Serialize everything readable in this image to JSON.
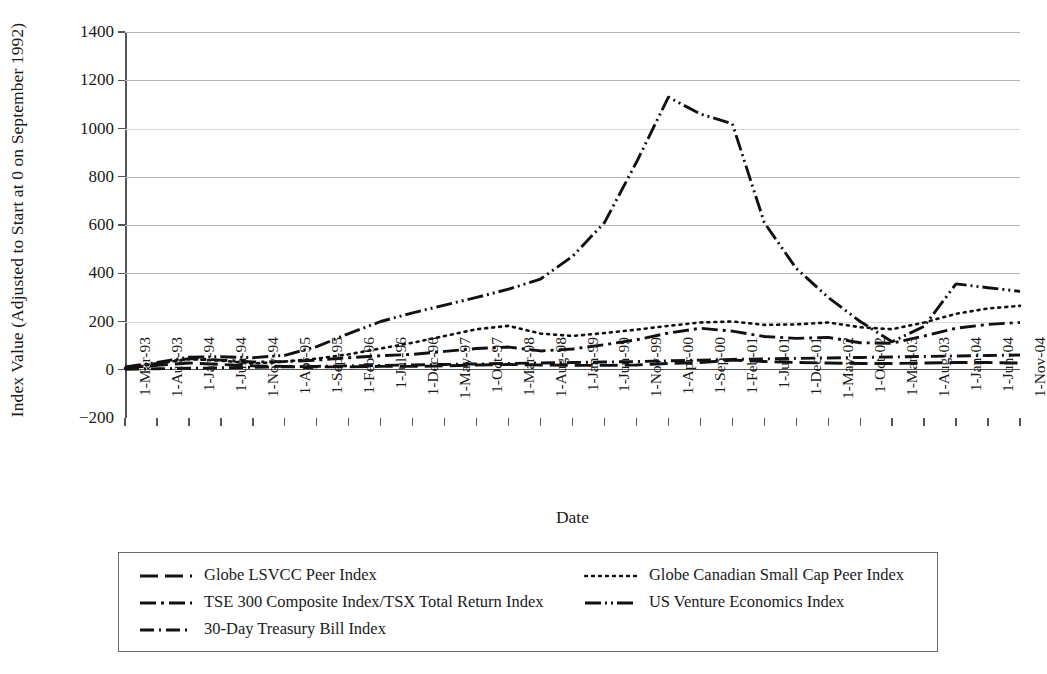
{
  "chart_data": {
    "type": "line",
    "title": "",
    "xlabel": "Date",
    "ylabel": "Index Value (Adjusted to Start at 0 on September 1992)",
    "ylim": [
      -200,
      1400
    ],
    "yticks": [
      -200,
      0,
      200,
      400,
      600,
      800,
      1000,
      1200,
      1400
    ],
    "grid": true,
    "legend_position": "bottom",
    "categories": [
      "1-Mar-93",
      "1-Aug-93",
      "1-Jan-94",
      "1-Jun-94",
      "1-Nov-94",
      "1-Apr-95",
      "1-Sep-95",
      "1-Feb-96",
      "1-Jul-96",
      "1-Dec-96",
      "1-May-97",
      "1-Oct-97",
      "1-Mar-98",
      "1-Aug-98",
      "1-Jan-99",
      "1-Jun-99",
      "1-Nov-99",
      "1-Apr-00",
      "1-Sep-00",
      "1-Feb-01",
      "1-Jul-01",
      "1-Dec-01",
      "1-May-02",
      "1-Oct-02",
      "1-Mar-03",
      "1-Aug-03",
      "1-Jan-04",
      "1-Jun-04",
      "1-Nov-04"
    ],
    "series": [
      {
        "name": "Globe LSVCC Peer Index",
        "dash": "18,7",
        "values": [
          8,
          18,
          28,
          22,
          16,
          14,
          12,
          12,
          14,
          14,
          16,
          20,
          22,
          20,
          18,
          18,
          20,
          26,
          30,
          40,
          34,
          30,
          28,
          26,
          26,
          28,
          30,
          30,
          28
        ]
      },
      {
        "name": "Globe Canadian Small Cap Peer Index",
        "dash": "2,5",
        "values": [
          6,
          26,
          44,
          38,
          26,
          34,
          46,
          64,
          88,
          112,
          140,
          168,
          182,
          150,
          140,
          152,
          166,
          182,
          196,
          200,
          186,
          188,
          196,
          176,
          168,
          196,
          232,
          254,
          265
        ]
      },
      {
        "name": "TSE 300 Composite Index/TSX Total Return Index",
        "dash": "16,5,3,5",
        "values": [
          10,
          26,
          46,
          40,
          32,
          34,
          40,
          50,
          58,
          64,
          76,
          88,
          94,
          78,
          86,
          104,
          124,
          152,
          172,
          160,
          138,
          130,
          134,
          112,
          110,
          140,
          172,
          188,
          196
        ]
      },
      {
        "name": "US Venture Economics Index",
        "dash": "16,4,2,4,2,4",
        "values": [
          12,
          30,
          52,
          54,
          50,
          60,
          96,
          150,
          200,
          236,
          268,
          300,
          334,
          376,
          470,
          610,
          860,
          1130,
          1060,
          1020,
          610,
          420,
          300,
          200,
          116,
          180,
          356,
          340,
          325
        ]
      },
      {
        "name": "30-Day Treasury Bill Index",
        "dash": "14,5,2,5",
        "values": [
          2,
          4,
          6,
          8,
          10,
          12,
          14,
          16,
          18,
          20,
          22,
          24,
          26,
          28,
          30,
          32,
          34,
          37,
          40,
          43,
          45,
          47,
          49,
          51,
          53,
          55,
          57,
          59,
          61
        ]
      }
    ]
  },
  "legend": {
    "rows": [
      {
        "left": {
          "label": "Globe LSVCC Peer Index",
          "dash": "18,7"
        },
        "right": {
          "label": "Globe Canadian Small Cap Peer Index",
          "dash": "2,5"
        }
      },
      {
        "left": {
          "label": "TSE 300 Composite Index/TSX Total Return Index",
          "dash": "16,5,3,5"
        },
        "right": {
          "label": "US Venture Economics Index",
          "dash": "16,4,2,4,2,4"
        }
      },
      {
        "left": {
          "label": "30-Day Treasury Bill Index",
          "dash": "14,5,2,5"
        },
        "right": null
      }
    ]
  },
  "colors": {
    "line": "#111111",
    "grid": "#b4b4b4",
    "axis": "#555555",
    "background": "#ffffff"
  }
}
